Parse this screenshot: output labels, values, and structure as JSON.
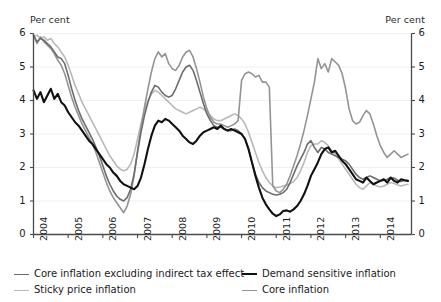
{
  "axes": {
    "unit_left": "Per cent",
    "unit_right": "Per cent",
    "y_ticks": [
      "0",
      "1",
      "2",
      "3",
      "4",
      "5",
      "6"
    ],
    "x_ticks": [
      "2004",
      "2005",
      "2006",
      "2007",
      "2008",
      "2009",
      "2010",
      "2011",
      "2012",
      "2013",
      "2014"
    ]
  },
  "legend": {
    "items": [
      {
        "label": "Core inflation excluding indirect tax effect",
        "color": "#6d6d6d",
        "width": 1.6
      },
      {
        "label": "Demand sensitive inflation",
        "color": "#111111",
        "width": 2.1
      },
      {
        "label": "Sticky price inflation",
        "color": "#b9b9b9",
        "width": 1.6
      },
      {
        "label": "Core inflation",
        "color": "#949494",
        "width": 1.6
      }
    ]
  },
  "chart_data": {
    "type": "line",
    "title": "",
    "xlabel": "",
    "ylabel": "Per cent",
    "xlim": [
      2004.0,
      2014.9
    ],
    "ylim": [
      0,
      6
    ],
    "grid": true,
    "legend_position": "bottom",
    "x": [
      2004.0,
      2004.1,
      2004.2,
      2004.3,
      2004.4,
      2004.5,
      2004.6,
      2004.7,
      2004.8,
      2004.9,
      2005.0,
      2005.1,
      2005.2,
      2005.3,
      2005.4,
      2005.5,
      2005.6,
      2005.7,
      2005.8,
      2005.9,
      2006.0,
      2006.1,
      2006.2,
      2006.3,
      2006.4,
      2006.5,
      2006.6,
      2006.7,
      2006.8,
      2006.9,
      2007.0,
      2007.1,
      2007.2,
      2007.3,
      2007.4,
      2007.5,
      2007.6,
      2007.7,
      2007.8,
      2007.9,
      2008.0,
      2008.1,
      2008.2,
      2008.3,
      2008.4,
      2008.5,
      2008.6,
      2008.7,
      2008.8,
      2008.9,
      2009.0,
      2009.1,
      2009.2,
      2009.3,
      2009.4,
      2009.5,
      2009.6,
      2009.7,
      2009.8,
      2009.9,
      2010.0,
      2010.1,
      2010.2,
      2010.3,
      2010.4,
      2010.5,
      2010.6,
      2010.7,
      2010.8,
      2010.9,
      2011.0,
      2011.1,
      2011.2,
      2011.3,
      2011.4,
      2011.5,
      2011.6,
      2011.7,
      2011.8,
      2011.9,
      2012.0,
      2012.1,
      2012.2,
      2012.3,
      2012.4,
      2012.5,
      2012.6,
      2012.7,
      2012.8,
      2012.9,
      2013.0,
      2013.1,
      2013.2,
      2013.3,
      2013.4,
      2013.5,
      2013.6,
      2013.7,
      2013.8,
      2013.9,
      2014.0,
      2014.1,
      2014.2,
      2014.3,
      2014.4,
      2014.5,
      2014.6,
      2014.7,
      2014.8
    ],
    "series": [
      {
        "name": "Core inflation excluding indirect tax effect",
        "color": "#6d6d6d",
        "width": 1.6,
        "values": [
          5.95,
          5.75,
          5.85,
          5.8,
          5.7,
          5.6,
          5.45,
          5.3,
          5.25,
          5.1,
          4.75,
          4.35,
          4.0,
          3.7,
          3.45,
          3.25,
          3.05,
          2.85,
          2.6,
          2.35,
          2.05,
          1.75,
          1.5,
          1.3,
          1.15,
          1.05,
          1.0,
          1.1,
          1.35,
          1.8,
          2.45,
          3.05,
          3.55,
          3.95,
          4.25,
          4.45,
          4.4,
          4.25,
          4.15,
          4.1,
          4.15,
          4.35,
          4.6,
          4.85,
          5.0,
          5.05,
          4.9,
          4.6,
          4.25,
          3.9,
          3.6,
          3.4,
          3.25,
          3.2,
          3.2,
          3.15,
          3.1,
          3.1,
          3.15,
          3.1,
          3.0,
          2.85,
          2.55,
          2.15,
          1.8,
          1.55,
          1.4,
          1.3,
          1.25,
          1.2,
          1.18,
          1.2,
          1.25,
          1.35,
          1.55,
          1.8,
          2.05,
          2.25,
          2.45,
          2.7,
          2.8,
          2.6,
          2.45,
          2.6,
          2.55,
          2.45,
          2.4,
          2.35,
          2.3,
          2.25,
          2.2,
          2.1,
          1.95,
          1.8,
          1.7,
          1.65,
          1.7,
          1.75,
          1.7,
          1.65,
          1.6,
          1.62,
          1.65,
          1.7,
          1.68,
          1.62,
          1.58,
          1.62,
          1.6
        ]
      },
      {
        "name": "Demand sensitive inflation",
        "color": "#111111",
        "width": 2.1,
        "values": [
          4.3,
          4.05,
          4.25,
          3.95,
          4.15,
          4.35,
          4.05,
          4.2,
          3.95,
          3.85,
          3.65,
          3.5,
          3.35,
          3.25,
          3.1,
          2.95,
          2.8,
          2.7,
          2.55,
          2.4,
          2.25,
          2.1,
          2.0,
          1.85,
          1.75,
          1.6,
          1.5,
          1.45,
          1.4,
          1.35,
          1.45,
          1.7,
          2.1,
          2.55,
          2.95,
          3.25,
          3.4,
          3.35,
          3.45,
          3.4,
          3.3,
          3.2,
          3.1,
          2.95,
          2.85,
          2.75,
          2.7,
          2.8,
          2.95,
          3.05,
          3.1,
          3.15,
          3.2,
          3.15,
          3.25,
          3.15,
          3.1,
          3.15,
          3.1,
          3.05,
          3.0,
          2.85,
          2.55,
          2.15,
          1.75,
          1.4,
          1.1,
          0.9,
          0.75,
          0.62,
          0.55,
          0.6,
          0.7,
          0.72,
          0.68,
          0.75,
          0.85,
          1.0,
          1.2,
          1.45,
          1.75,
          1.95,
          2.15,
          2.4,
          2.55,
          2.6,
          2.45,
          2.5,
          2.35,
          2.2,
          2.1,
          1.95,
          1.8,
          1.65,
          1.6,
          1.55,
          1.7,
          1.6,
          1.5,
          1.55,
          1.6,
          1.65,
          1.55,
          1.7,
          1.6,
          1.55,
          1.65,
          1.62,
          1.6
        ]
      },
      {
        "name": "Sticky price inflation",
        "color": "#b9b9b9",
        "width": 1.6,
        "values": [
          5.9,
          5.95,
          5.85,
          5.9,
          5.8,
          5.85,
          5.7,
          5.6,
          5.45,
          5.3,
          5.05,
          4.75,
          4.45,
          4.2,
          3.95,
          3.75,
          3.55,
          3.35,
          3.15,
          2.95,
          2.75,
          2.55,
          2.35,
          2.2,
          2.05,
          1.95,
          1.9,
          1.95,
          2.1,
          2.4,
          2.85,
          3.3,
          3.7,
          4.0,
          4.2,
          4.3,
          4.25,
          4.15,
          4.05,
          3.95,
          3.85,
          3.75,
          3.7,
          3.65,
          3.6,
          3.65,
          3.7,
          3.75,
          3.8,
          3.75,
          3.65,
          3.55,
          3.45,
          3.4,
          3.4,
          3.45,
          3.5,
          3.55,
          3.6,
          3.55,
          3.45,
          3.3,
          3.05,
          2.75,
          2.45,
          2.15,
          1.9,
          1.7,
          1.55,
          1.45,
          1.4,
          1.42,
          1.45,
          1.48,
          1.52,
          1.58,
          1.7,
          1.9,
          2.15,
          2.45,
          2.65,
          2.7,
          2.7,
          2.8,
          2.75,
          2.65,
          2.5,
          2.4,
          2.25,
          2.1,
          1.95,
          1.8,
          1.65,
          1.5,
          1.4,
          1.35,
          1.45,
          1.55,
          1.5,
          1.45,
          1.42,
          1.45,
          1.5,
          1.55,
          1.52,
          1.48,
          1.45,
          1.48,
          1.5
        ]
      },
      {
        "name": "Core inflation",
        "color": "#949494",
        "width": 1.6,
        "values": [
          5.95,
          5.7,
          5.9,
          5.75,
          5.65,
          5.55,
          5.4,
          5.2,
          5.05,
          4.8,
          4.45,
          4.1,
          3.8,
          3.55,
          3.3,
          3.1,
          2.9,
          2.7,
          2.45,
          2.15,
          1.85,
          1.55,
          1.3,
          1.1,
          0.95,
          0.8,
          0.65,
          0.85,
          1.2,
          1.75,
          2.5,
          3.2,
          3.8,
          4.35,
          4.85,
          5.25,
          5.45,
          5.3,
          5.4,
          5.1,
          4.95,
          4.9,
          5.05,
          5.3,
          5.45,
          5.5,
          5.3,
          4.95,
          4.55,
          4.1,
          3.75,
          3.5,
          3.35,
          3.3,
          3.3,
          3.25,
          3.2,
          3.25,
          3.3,
          3.4,
          4.6,
          4.8,
          4.85,
          4.8,
          4.7,
          4.75,
          4.55,
          4.55,
          4.4,
          1.45,
          1.3,
          1.25,
          1.35,
          1.5,
          1.75,
          2.05,
          2.35,
          2.7,
          3.1,
          3.55,
          4.05,
          4.55,
          5.25,
          4.95,
          5.1,
          4.85,
          5.25,
          5.15,
          5.05,
          4.8,
          4.35,
          3.75,
          3.4,
          3.3,
          3.35,
          3.55,
          3.7,
          3.6,
          3.3,
          2.95,
          2.65,
          2.45,
          2.3,
          2.4,
          2.5,
          2.4,
          2.3,
          2.35,
          2.4
        ]
      }
    ]
  }
}
